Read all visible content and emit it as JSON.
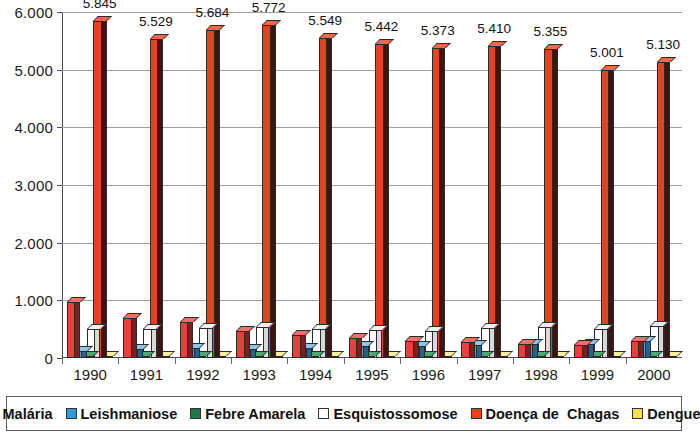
{
  "chart_data": {
    "type": "bar",
    "title": "",
    "subtitle": "",
    "xlabel": "",
    "ylabel": "",
    "grid": true,
    "legend_position": "bottom",
    "style": "3d-clustered-column",
    "ylim": [
      0,
      6000
    ],
    "ytick_labels": [
      "0",
      "1.000",
      "2.000",
      "3.000",
      "4.000",
      "5.000",
      "6.000"
    ],
    "ytick_values": [
      0,
      1000,
      2000,
      3000,
      4000,
      5000,
      6000
    ],
    "categories": [
      "1990",
      "1991",
      "1992",
      "1993",
      "1994",
      "1995",
      "1996",
      "1997",
      "1998",
      "1999",
      "2000"
    ],
    "series": [
      {
        "name": "Malária",
        "color": "#e8413c",
        "side_color": "#7d1f1c",
        "top_color": "#f0706a",
        "values": [
          980,
          700,
          620,
          470,
          400,
          350,
          300,
          270,
          250,
          230,
          290
        ],
        "labels": [
          "",
          "",
          "",
          "",
          "",
          "",
          "",
          "",
          "",
          "",
          ""
        ]
      },
      {
        "name": "Leishmaniose",
        "color": "#4d9fd8",
        "side_color": "#27628c",
        "top_color": "#8cc6ea",
        "values": [
          130,
          160,
          170,
          150,
          180,
          200,
          210,
          230,
          240,
          250,
          290
        ],
        "labels": [
          "",
          "",
          "",
          "",
          "",
          "",
          "",
          "",
          "",
          "",
          ""
        ]
      },
      {
        "name": "Febre Amarela",
        "color": "#1b7a48",
        "side_color": "#0d4328",
        "top_color": "#4aa873",
        "values": [
          10,
          10,
          10,
          10,
          10,
          10,
          10,
          10,
          10,
          10,
          10
        ],
        "labels": [
          "",
          "",
          "",
          "",
          "",
          "",
          "",
          "",
          "",
          "",
          ""
        ]
      },
      {
        "name": "Esquistossomose",
        "color": "#ffffff",
        "side_color": "#d8d8d8",
        "top_color": "#f2f2f2",
        "values": [
          500,
          510,
          520,
          530,
          500,
          480,
          470,
          520,
          530,
          500,
          560
        ],
        "labels": [
          "",
          "",
          "",
          "",
          "",
          "",
          "",
          "",
          "",
          "",
          ""
        ]
      },
      {
        "name": "Doença de  Chagas",
        "color": "#e8411f",
        "side_color": "#3d1510",
        "top_color": "#f06a4a",
        "values": [
          5845,
          5529,
          5684,
          5772,
          5549,
          5442,
          5373,
          5410,
          5355,
          5001,
          5130
        ],
        "labels": [
          "5.845",
          "5.529",
          "5.684",
          "5.772",
          "5.549",
          "5.442",
          "5.373",
          "5.410",
          "5.355",
          "5.001",
          "5.130"
        ]
      },
      {
        "name": "Dengue",
        "color": "#f4e04a",
        "side_color": "#a89a20",
        "top_color": "#faf0a0",
        "values": [
          25,
          25,
          25,
          25,
          25,
          25,
          25,
          25,
          25,
          25,
          25
        ],
        "labels": [
          "",
          "",
          "",
          "",
          "",
          "",
          "",
          "",
          "",
          "",
          ""
        ]
      }
    ]
  },
  "legend": {
    "items": [
      {
        "label": "Malária",
        "color": "#e8413c"
      },
      {
        "label": "Leishmaniose",
        "color": "#2e9bd8"
      },
      {
        "label": "Febre Amarela",
        "color": "#1b7a48"
      },
      {
        "label": "Esquistossomose",
        "color": "#ffffff"
      },
      {
        "label": "Doença de  Chagas",
        "color": "#e8411f"
      },
      {
        "label": "Dengue",
        "color": "#f4e04a"
      }
    ]
  },
  "colors": {
    "background": "#ffffff",
    "axis": "#4a4a4a",
    "gridline": "#9d9d9d",
    "text": "#1a1a1a"
  }
}
